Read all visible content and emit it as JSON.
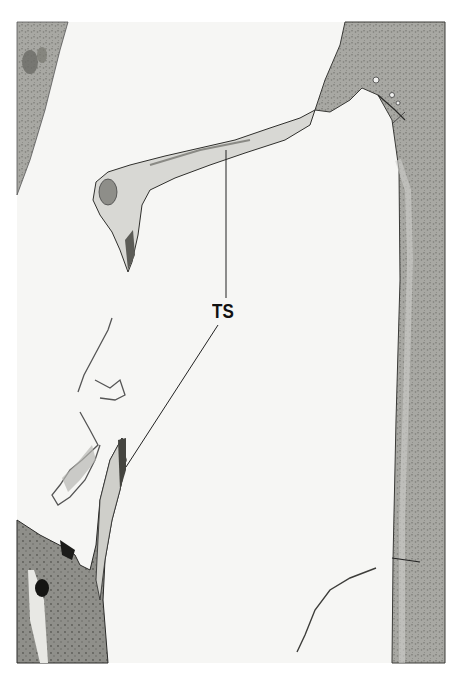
{
  "figure": {
    "type": "histology-micrograph",
    "label": "TS",
    "colors": {
      "background": "#ffffff",
      "field": "#f7f7f5",
      "tissue_light": "#d9d9d5",
      "tissue_mid": "#a9a9a4",
      "tissue_dark": "#6f6f6a",
      "outline": "#2a2a28"
    }
  }
}
